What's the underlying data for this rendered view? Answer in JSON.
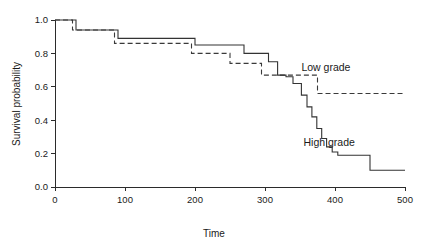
{
  "chart_data": {
    "type": "line",
    "subtype": "kaplan-meier-step",
    "title": "",
    "xlabel": "Time",
    "ylabel": "Survival probability",
    "xlim": [
      0,
      500
    ],
    "ylim": [
      0.0,
      1.0
    ],
    "xticks": [
      0,
      100,
      200,
      300,
      400,
      500
    ],
    "xtick_labels": [
      "0",
      "100",
      "200",
      "300",
      "400",
      "500"
    ],
    "yticks": [
      0.0,
      0.2,
      0.4,
      0.6,
      0.8,
      1.0
    ],
    "ytick_labels": [
      "0.0",
      "0.2",
      "0.4",
      "0.6",
      "0.8",
      "1.0"
    ],
    "grid": false,
    "legend_position": "inline-annotation",
    "series": [
      {
        "name": "Low grade",
        "style": "dashed",
        "color": "#3a3a3a",
        "label_x": 352,
        "label_y": 0.695,
        "x": [
          0,
          25,
          85,
          195,
          250,
          295,
          375,
          500
        ],
        "y": [
          1.0,
          0.94,
          0.86,
          0.8,
          0.74,
          0.67,
          0.56,
          0.56
        ]
      },
      {
        "name": "High grade",
        "style": "solid",
        "color": "#333333",
        "label_x": 355,
        "label_y": 0.245,
        "x": [
          0,
          30,
          90,
          200,
          270,
          305,
          318,
          330,
          340,
          352,
          360,
          367,
          374,
          381,
          388,
          396,
          404,
          450,
          500
        ],
        "y": [
          1.0,
          0.94,
          0.89,
          0.85,
          0.8,
          0.75,
          0.67,
          0.66,
          0.62,
          0.55,
          0.48,
          0.42,
          0.35,
          0.29,
          0.24,
          0.21,
          0.19,
          0.1,
          0.1
        ]
      }
    ]
  },
  "axes": {
    "x_axis_name": "time-axis",
    "y_axis_name": "survival-probability-axis"
  }
}
